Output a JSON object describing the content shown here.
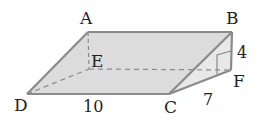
{
  "diagram": {
    "type": "geometry-solid",
    "colors": {
      "edge": "#8a8a8a",
      "face": "#dcdcdc",
      "face_side": "#e6e6e6",
      "text": "#222222"
    },
    "vertices": {
      "A": {
        "label": "A",
        "x": 88,
        "y": 32
      },
      "B": {
        "label": "B",
        "x": 232,
        "y": 32
      },
      "C": {
        "label": "C",
        "x": 169,
        "y": 94
      },
      "D": {
        "label": "D",
        "x": 27,
        "y": 94
      },
      "E": {
        "label": "E",
        "x": 89,
        "y": 69
      },
      "F": {
        "label": "F",
        "x": 231,
        "y": 70
      }
    },
    "measurements": {
      "DC": "10",
      "BF": "4",
      "CF": "7"
    },
    "hidden_edges": [
      "AE",
      "DE",
      "EF"
    ],
    "right_angle_at": "F"
  }
}
